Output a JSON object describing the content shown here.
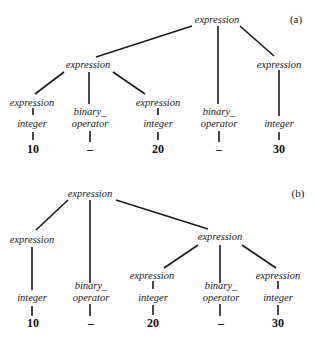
{
  "figure": {
    "panels": [
      {
        "id": "a",
        "caption": "(a)",
        "nodes": {
          "root": "expression",
          "left_expr": "expression",
          "left_left_expr": "expression",
          "left_left_int": "integer",
          "left_left_val": "10",
          "left_op_1": "binary_",
          "left_op_2": "operator",
          "left_op_val": "–",
          "left_right_expr": "expression",
          "left_right_int": "integer",
          "left_right_val": "20",
          "mid_op_1": "binary_",
          "mid_op_2": "operator",
          "mid_op_val": "–",
          "right_expr": "expression",
          "right_int": "integer",
          "right_val": "30"
        }
      },
      {
        "id": "b",
        "caption": "(b)",
        "nodes": {
          "root": "expression",
          "left_expr": "expression",
          "left_int": "integer",
          "left_val": "10",
          "mid_op_1": "binary_",
          "mid_op_2": "operator",
          "mid_op_val": "–",
          "right_expr": "expression",
          "right_left_expr": "expression",
          "right_left_int": "integer",
          "right_left_val": "20",
          "right_op_1": "binary_",
          "right_op_2": "operator",
          "right_op_val": "–",
          "right_right_expr": "expression",
          "right_right_int": "integer",
          "right_right_val": "30"
        }
      }
    ]
  }
}
